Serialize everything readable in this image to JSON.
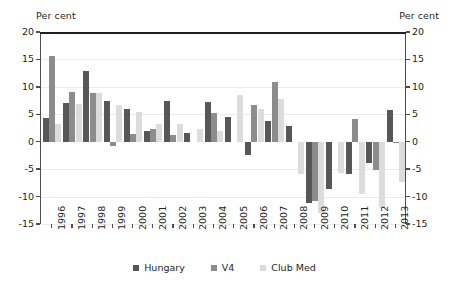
{
  "axis": {
    "left_title": "Per cent",
    "right_title": "Per cent",
    "yticks": [
      20,
      15,
      10,
      5,
      0,
      -5,
      -10,
      -15
    ]
  },
  "legend": {
    "items": [
      {
        "label": "Hungary",
        "color": "#575757"
      },
      {
        "label": "V4",
        "color": "#8c8c8c"
      },
      {
        "label": "Club Med",
        "color": "#dcdcdc"
      }
    ]
  },
  "chart_data": {
    "type": "bar",
    "title": "",
    "xlabel": "",
    "ylabel": "Per cent",
    "ylim": [
      -15,
      20
    ],
    "ytick_step": 5,
    "grid": true,
    "legend_position": "bottom",
    "categories": [
      "1996",
      "1997",
      "1998",
      "1999",
      "2000",
      "2001",
      "2002",
      "2003",
      "2004",
      "2005",
      "2006",
      "2007",
      "2008",
      "2009",
      "2010",
      "2011",
      "2012",
      "2013"
    ],
    "series": [
      {
        "name": "Hungary",
        "color": "#575757",
        "values": [
          4.4,
          7.1,
          12.8,
          7.4,
          5.9,
          1.9,
          7.4,
          1.5,
          7.2,
          4.5,
          -2.5,
          3.8,
          2.8,
          -11.1,
          -8.6,
          -5.9,
          -3.8,
          5.8
        ]
      },
      {
        "name": "V4",
        "color": "#8c8c8c",
        "values": [
          15.7,
          9.1,
          8.8,
          -0.7,
          1.4,
          2.4,
          1.2,
          0.0,
          5.3,
          0.0,
          6.7,
          10.8,
          0.0,
          -10.8,
          0.0,
          4.2,
          -5.2,
          -0.3
        ]
      },
      {
        "name": "Club Med",
        "color": "#dcdcdc",
        "values": [
          3.3,
          6.9,
          8.9,
          6.7,
          5.4,
          3.3,
          3.2,
          2.3,
          1.9,
          8.5,
          5.9,
          7.8,
          -5.8,
          -13.0,
          -5.7,
          -9.6,
          -12.1,
          -7.3
        ]
      }
    ]
  }
}
